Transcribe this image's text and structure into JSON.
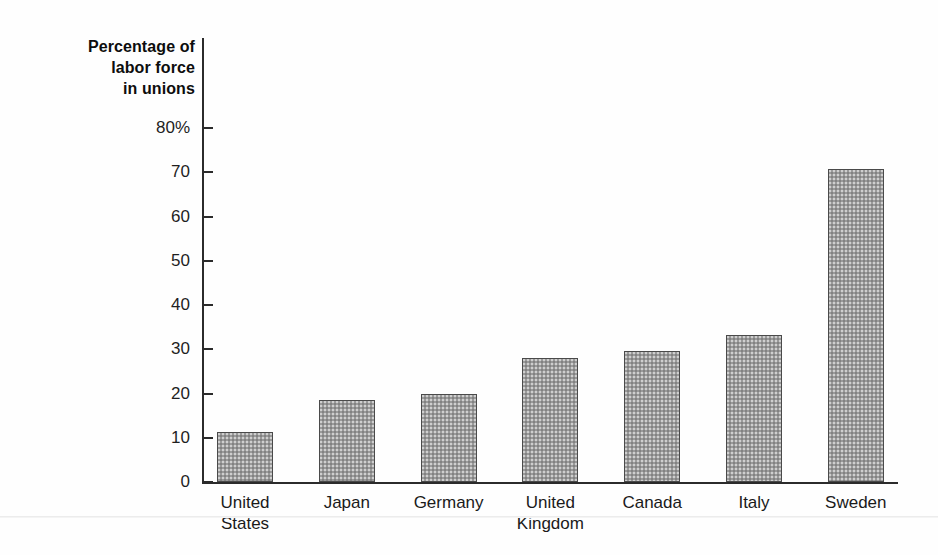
{
  "figure": {
    "background_color": "#ffffff",
    "axis_color": "#2b2b2b",
    "bar_fill_color": "#9a9a9a",
    "bar_border_color": "#4a4a4a",
    "text_color": "#1a1a1a"
  },
  "chart_data": {
    "type": "bar",
    "title": "",
    "axis_title_lines": [
      "Percentage of",
      "labor force",
      "in unions"
    ],
    "ylabel": "Percentage of labor force in unions",
    "xlabel": "",
    "categories": [
      "United States",
      "Japan",
      "Germany",
      "United Kingdom",
      "Canada",
      "Italy",
      "Sweden"
    ],
    "category_label_lines": [
      [
        "United",
        "States"
      ],
      [
        "Japan"
      ],
      [
        "Germany"
      ],
      [
        "United",
        "Kingdom"
      ],
      [
        "Canada"
      ],
      [
        "Italy"
      ],
      [
        "Sweden"
      ]
    ],
    "values": [
      11.2,
      18.5,
      19.8,
      28.0,
      29.5,
      33.2,
      70.8
    ],
    "ylim": [
      0,
      80
    ],
    "yticks": [
      0,
      10,
      20,
      30,
      40,
      50,
      60,
      70,
      80
    ],
    "ytick_labels": [
      "0",
      "10",
      "20",
      "30",
      "40",
      "50",
      "60",
      "70",
      "80%"
    ],
    "grid": false,
    "legend": false
  }
}
